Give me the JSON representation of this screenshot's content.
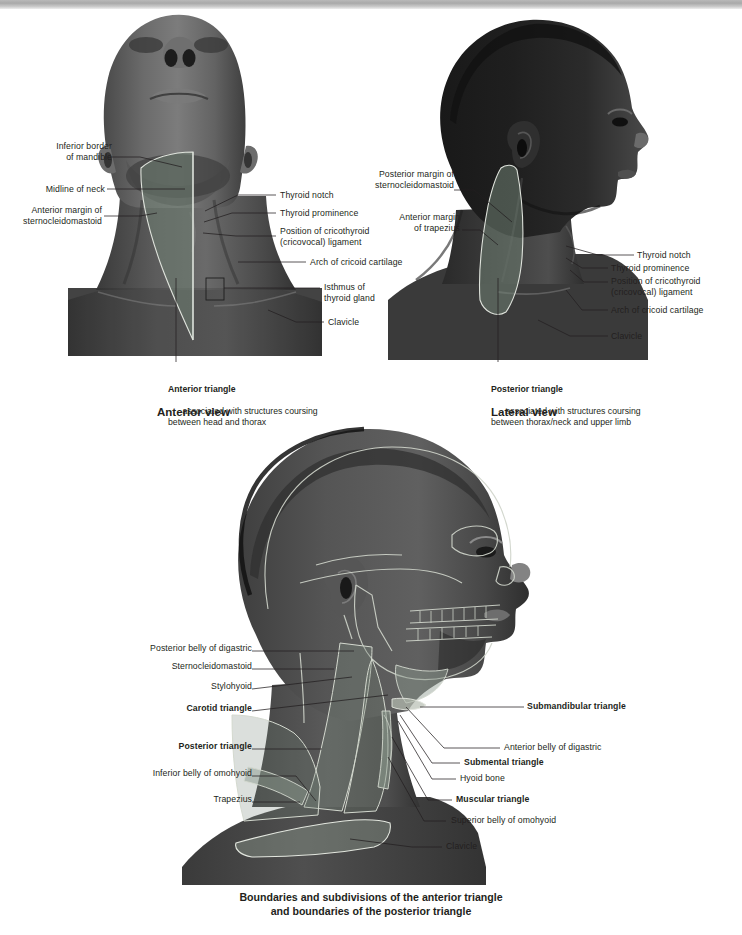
{
  "figure": {
    "title_caption": "Boundaries and subdivisions of the anterior triangle\nand boundaries of the posterior triangle"
  },
  "colors": {
    "overlay_triangle": "#6f7f72",
    "overlay_outline": "#d8dcd4",
    "label_text": "#231f20",
    "leader_line": "#231f20",
    "background": "#ffffff",
    "page_edge_bar": "#b0b0b0"
  },
  "panels": {
    "anterior": {
      "view_name": "Anterior view",
      "caption_title": "Anterior triangle",
      "caption_body": "associated with structures coursing\nbetween head and thorax",
      "labels_left": [
        {
          "text": "Inferior border\nof mandible",
          "x": 36,
          "y": 142
        },
        {
          "text": "Midline of neck",
          "x": 41,
          "y": 188
        },
        {
          "text": "Anterior margin of\nsternocleidomastoid",
          "x": 30,
          "y": 208
        }
      ],
      "labels_right": [
        {
          "text": "Thyroid notch",
          "x": 281,
          "y": 193
        },
        {
          "text": "Thyroid prominence",
          "x": 281,
          "y": 211
        },
        {
          "text": "Position of cricothyroid\n(cricovocal) ligament",
          "x": 281,
          "y": 229
        },
        {
          "text": "Arch of cricoid cartilage",
          "x": 311,
          "y": 260
        },
        {
          "text": "Isthmus of\nthyroid gland",
          "x": 325,
          "y": 283
        },
        {
          "text": "Clavicle",
          "x": 329,
          "y": 320
        }
      ]
    },
    "lateral": {
      "view_name": "Lateral view",
      "caption_title": "Posterior triangle",
      "caption_body": "associated with structures coursing\nbetween thorax/neck and upper limb",
      "labels_left": [
        {
          "text": "Posterior margin of\nsternocleidomastoid",
          "x": 368,
          "y": 172
        },
        {
          "text": "Anterior margin\nof trapezius",
          "x": 378,
          "y": 215
        }
      ],
      "labels_right": [
        {
          "text": "Thyroid notch",
          "x": 637,
          "y": 250
        },
        {
          "text": "Thyroid prominence",
          "x": 611,
          "y": 263
        },
        {
          "text": "Position of cricothyroid\n(cricovocal) ligament",
          "x": 611,
          "y": 275
        },
        {
          "text": "Arch of cricoid cartilage",
          "x": 611,
          "y": 305
        },
        {
          "text": "Clavicle",
          "x": 611,
          "y": 332
        }
      ]
    },
    "bottom": {
      "labels_left": [
        {
          "text": "Posterior belly of digastric",
          "x": 117,
          "y": 647,
          "bold": false
        },
        {
          "text": "Sternocleidomastoid",
          "x": 164,
          "y": 665,
          "bold": false
        },
        {
          "text": "Stylohyoid",
          "x": 206,
          "y": 685,
          "bold": false
        },
        {
          "text": "Carotid triangle",
          "x": 164,
          "y": 708,
          "bold": true
        },
        {
          "text": "Posterior triangle",
          "x": 135,
          "y": 745,
          "bold": true
        },
        {
          "text": "Inferior belly of omohyoid",
          "x": 89,
          "y": 772,
          "bold": false
        },
        {
          "text": "Trapezius",
          "x": 147,
          "y": 798,
          "bold": false
        }
      ],
      "labels_right": [
        {
          "text": "Submandibular triangle",
          "x": 527,
          "y": 704,
          "bold": true
        },
        {
          "text": "Anterior belly of digastric",
          "x": 504,
          "y": 744,
          "bold": false
        },
        {
          "text": "Submental triangle",
          "x": 464,
          "y": 759,
          "bold": true
        },
        {
          "text": "Hyoid bone",
          "x": 459,
          "y": 775,
          "bold": false
        },
        {
          "text": "Muscular triangle",
          "x": 455,
          "y": 796,
          "bold": true
        },
        {
          "text": "Superior belly of omohyoid",
          "x": 450,
          "y": 817,
          "bold": false
        },
        {
          "text": "Clavicle",
          "x": 446,
          "y": 843,
          "bold": false
        }
      ]
    }
  }
}
